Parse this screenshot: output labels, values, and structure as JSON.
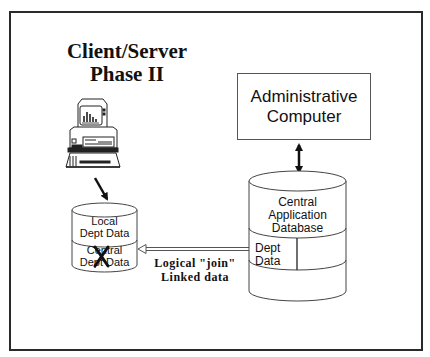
{
  "diagram": {
    "title_line1": "Client/Server",
    "title_line2": "Phase II",
    "admin_computer": {
      "line1": "Administrative",
      "line2": "Computer"
    },
    "local_db": {
      "top_label_line1": "Local",
      "top_label_line2": "Dept Data",
      "bottom_label_line1": "Central",
      "bottom_label_line2": "Dept Data",
      "crossed_out": true
    },
    "central_db": {
      "label_line1": "Central",
      "label_line2": "Application",
      "label_line3": "Database",
      "section_label_line1": "Dept",
      "section_label_line2": "Data"
    },
    "link": {
      "line1": "Logical \"join\"",
      "line2": "Linked data"
    },
    "icons": [
      "desktop-computer-icon",
      "database-cylinder-icon",
      "bidirectional-arrow",
      "hollow-arrow"
    ]
  }
}
